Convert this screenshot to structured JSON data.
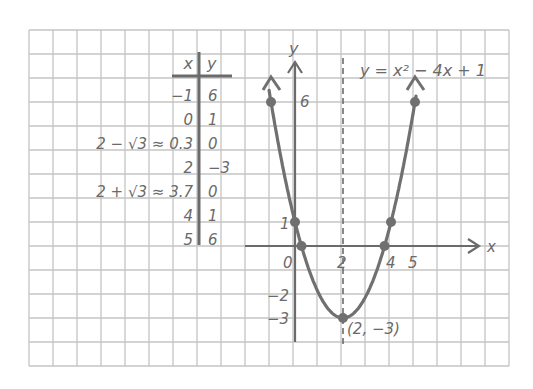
{
  "colors": {
    "background": "#ffffff",
    "grid": "#c4c4c4",
    "ink": "#6b6b6b",
    "curve": "#707070",
    "table_rule": "#6b6b6b"
  },
  "grid": {
    "left": 29,
    "top": 30,
    "cell": 24,
    "cols": 20,
    "rows": 14
  },
  "table": {
    "headers": {
      "x": "x",
      "y": "y"
    },
    "rows": [
      {
        "x": "−1",
        "y": "6"
      },
      {
        "x": "0",
        "y": "1"
      },
      {
        "x": "2 − √3 ≈ 0.3",
        "y": "0"
      },
      {
        "x": "2",
        "y": "−3"
      },
      {
        "x": "2 + √3 ≈ 3.7",
        "y": "0"
      },
      {
        "x": "4",
        "y": "1"
      },
      {
        "x": "5",
        "y": "6"
      }
    ]
  },
  "graph": {
    "equation": "y = x² − 4x + 1",
    "x_axis_label": "x",
    "y_axis_label": "y",
    "x_ticks": [
      "0",
      "2",
      "4",
      "5"
    ],
    "y_ticks": [
      "6",
      "1",
      "−2",
      "−3"
    ],
    "vertex_label": "(2, −3)",
    "axis_of_symmetry": "x = 2 (dashed)"
  },
  "chart_data": {
    "type": "line",
    "title": "y = x² − 4x + 1",
    "xlabel": "x",
    "ylabel": "y",
    "x": [
      -1,
      0,
      0.27,
      2,
      3.73,
      4,
      5
    ],
    "series": [
      {
        "name": "y = x² − 4x + 1",
        "values": [
          6,
          1,
          0,
          -3,
          0,
          1,
          6
        ]
      }
    ],
    "plotted_points": [
      [
        -1,
        6
      ],
      [
        0,
        1
      ],
      [
        0.3,
        0
      ],
      [
        2,
        -3
      ],
      [
        3.7,
        0
      ],
      [
        4,
        1
      ],
      [
        5,
        6
      ]
    ],
    "vertex": [
      2,
      -3
    ],
    "axis_of_symmetry": 2,
    "xlim": [
      -1.5,
      8
    ],
    "ylim": [
      -5,
      8
    ],
    "grid": true,
    "x_tick_labels": [
      "0",
      "2",
      "4",
      "5"
    ],
    "y_tick_labels": [
      "6",
      "1",
      "−2",
      "−3"
    ],
    "annotations": [
      "(2, −3)",
      "y = x² − 4x + 1"
    ]
  }
}
